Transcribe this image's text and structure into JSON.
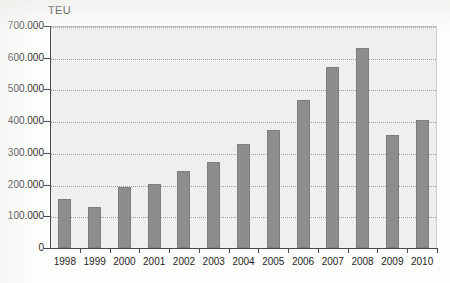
{
  "chart_data": {
    "type": "bar",
    "title": "",
    "subtitle": "",
    "ylabel": "TEU",
    "xlabel": "",
    "ylim": [
      0,
      700000
    ],
    "ytick_step": 100000,
    "grid": true,
    "legend": null,
    "number_format": "european-dot-thousands",
    "categories": [
      "1998",
      "1999",
      "2000",
      "2001",
      "2002",
      "2003",
      "2004",
      "2005",
      "2006",
      "2007",
      "2008",
      "2009",
      "2010"
    ],
    "values": [
      155000,
      130000,
      192000,
      202000,
      243000,
      272000,
      328000,
      372000,
      468000,
      570000,
      632000,
      355000,
      405000
    ],
    "ytick_labels": [
      "700.000",
      "600.000",
      "500.000",
      "400.000",
      "300.000",
      "200.000",
      "100.000",
      "0"
    ],
    "ytick_values": [
      700000,
      600000,
      500000,
      400000,
      300000,
      200000,
      100000,
      0
    ],
    "bar_color": "#8d8d8b",
    "plot_background": "#efefee",
    "axis_color": "#4a4a48",
    "gridline_color": "#8e8e8a"
  }
}
